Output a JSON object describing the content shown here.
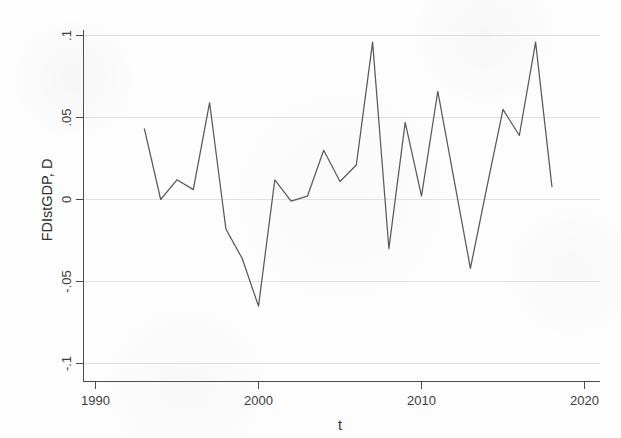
{
  "chart_data": {
    "type": "line",
    "title": "",
    "xlabel": "t",
    "ylabel": "FDIstGDP, D",
    "xlim": [
      1990,
      2020
    ],
    "ylim": [
      -0.1,
      0.1
    ],
    "xticks": [
      1990,
      2000,
      2010,
      2020
    ],
    "xtick_labels": [
      "1990",
      "2000",
      "2010",
      "2020"
    ],
    "yticks": [
      0.1,
      0.05,
      0,
      -0.05,
      -0.1
    ],
    "ytick_labels": [
      ".1",
      ".05",
      "0",
      "-.05",
      "-.1"
    ],
    "grid": true,
    "grid_axis": "y",
    "legend": false,
    "legend_position": "none",
    "line_color": "#555a5f",
    "grid_color": "#e2e2e2",
    "axis_color": "#4a4a4a",
    "background_color": "#fdfdfd",
    "series": [
      {
        "name": "FDIstGDP, D",
        "x": [
          1993,
          1994,
          1995,
          1996,
          1997,
          1998,
          1999,
          2000,
          2001,
          2002,
          2003,
          2004,
          2005,
          2006,
          2007,
          2008,
          2009,
          2010,
          2011,
          2012,
          2013,
          2014,
          2015,
          2016,
          2017,
          2018
        ],
        "values": [
          0.043,
          0.0,
          0.012,
          0.006,
          0.059,
          -0.018,
          -0.036,
          -0.065,
          0.012,
          -0.001,
          0.002,
          0.03,
          0.011,
          0.021,
          0.096,
          -0.03,
          0.047,
          0.002,
          0.066,
          0.012,
          -0.042,
          0.007,
          0.055,
          0.039,
          0.096,
          0.008
        ]
      }
    ]
  },
  "axes": {
    "y_title": "FDIstGDP, D",
    "x_title": "t"
  }
}
